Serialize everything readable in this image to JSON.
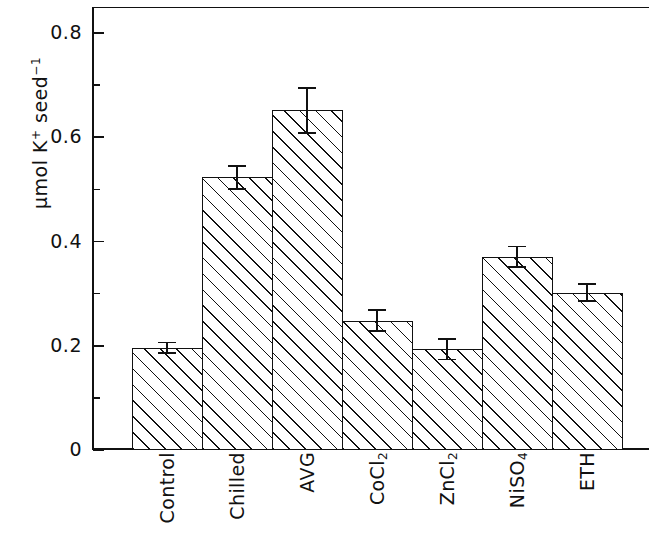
{
  "chart_data": {
    "type": "bar",
    "title": "",
    "subtitle": "",
    "xlabel": "",
    "ylabel": "µmol K⁺ seed⁻¹",
    "ylabel_parts": {
      "main": "µmol K",
      "sup1": "+",
      "mid": " seed",
      "sup2": "−1"
    },
    "categories": [
      "Control",
      "Chilled",
      "AVG",
      "CoCl2",
      "ZnCl2",
      "NiSO4",
      "ETH"
    ],
    "category_labels": [
      {
        "text": "Control",
        "base": "Control",
        "sub": ""
      },
      {
        "text": "Chilled",
        "base": "Chilled",
        "sub": ""
      },
      {
        "text": "AVG",
        "base": "AVG",
        "sub": ""
      },
      {
        "text": "CoCl₂",
        "base": "CoCl",
        "sub": "2"
      },
      {
        "text": "ZnCl₂",
        "base": "ZnCl",
        "sub": "2"
      },
      {
        "text": "NiSO₄",
        "base": "NiSO",
        "sub": "4"
      },
      {
        "text": "ETH",
        "base": "ETH",
        "sub": ""
      }
    ],
    "values": [
      0.196,
      0.523,
      0.652,
      0.248,
      0.193,
      0.371,
      0.302
    ],
    "errors": [
      0.012,
      0.024,
      0.045,
      0.022,
      0.021,
      0.021,
      0.018
    ],
    "ylim": [
      0,
      0.85
    ],
    "yticks": [
      0,
      0.2,
      0.4,
      0.6,
      0.8
    ],
    "ytick_labels": [
      "0",
      "0.2",
      "0.4",
      "0.6",
      "0.8"
    ],
    "yminorticks": [
      0.1,
      0.3,
      0.5,
      0.7
    ],
    "grid": false,
    "legend": false,
    "bar_fill": "hatch-diagonal",
    "bar_color": "#ffffff",
    "line_color": "#111111",
    "error_bar_style": "capped"
  }
}
